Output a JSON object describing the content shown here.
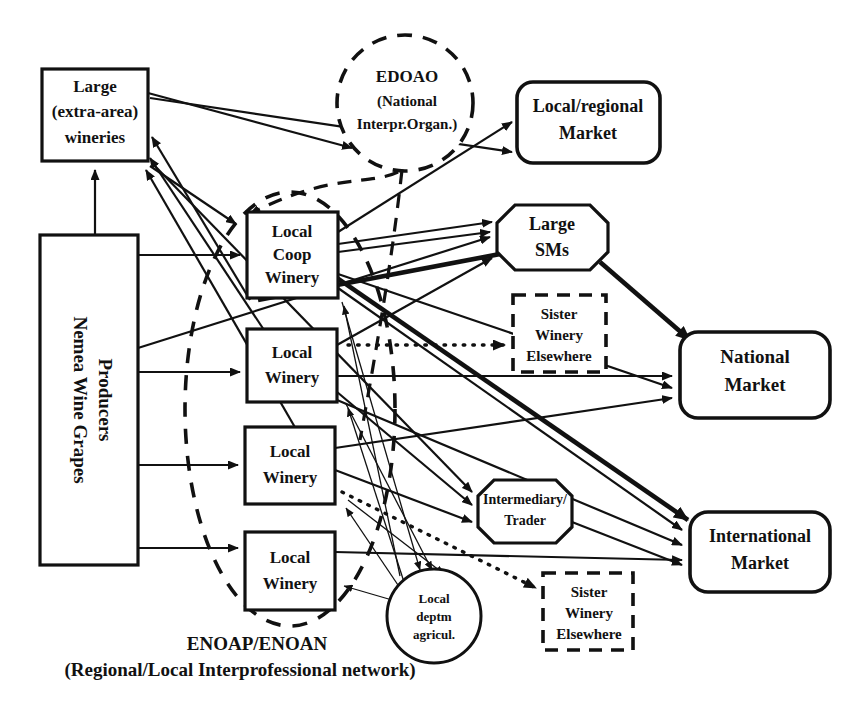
{
  "diagram": {
    "type": "network-flow-diagram",
    "colors": {
      "stroke": "#111111",
      "fill": "#ffffff",
      "background": "#ffffff"
    },
    "nodes": [
      {
        "id": "large-extra-area-wineries",
        "label": "Large\n(extra-area)\nwineries",
        "lines": [
          "Large",
          "(extra-area)",
          "wineries"
        ],
        "shape": "rectangle",
        "border": "solid"
      },
      {
        "id": "nemea-wine-grapes-producers",
        "label": "Nemea Wine Grapes Producers",
        "lines": [
          "Nemea Wine Grapes",
          "Producers"
        ],
        "shape": "rectangle",
        "border": "solid",
        "orientation": "vertical"
      },
      {
        "id": "edoao",
        "label": "EDOAO (National Interpr.Organ.)",
        "lines": [
          "EDOAO",
          "(National",
          "Interpr.Organ.)"
        ],
        "shape": "circle",
        "border": "dashed"
      },
      {
        "id": "local-coop-winery",
        "label": "Local Coop Winery",
        "lines": [
          "Local",
          "Coop",
          "Winery"
        ],
        "shape": "rectangle",
        "border": "solid"
      },
      {
        "id": "local-winery-1",
        "label": "Local Winery",
        "lines": [
          "Local",
          "Winery"
        ],
        "shape": "rectangle",
        "border": "solid"
      },
      {
        "id": "local-winery-2",
        "label": "Local Winery",
        "lines": [
          "Local",
          "Winery"
        ],
        "shape": "rectangle",
        "border": "solid"
      },
      {
        "id": "local-winery-3",
        "label": "Local Winery",
        "lines": [
          "Local",
          "Winery"
        ],
        "shape": "rectangle",
        "border": "solid"
      },
      {
        "id": "local-regional-market",
        "label": "Local/regional Market",
        "lines": [
          "Local/regional",
          "Market"
        ],
        "shape": "rounded-rectangle",
        "border": "solid"
      },
      {
        "id": "large-sms",
        "label": "Large SMs",
        "lines": [
          "Large",
          "SMs"
        ],
        "shape": "octagon",
        "border": "solid"
      },
      {
        "id": "sister-winery-elsewhere-top",
        "label": "Sister Winery Elsewhere",
        "lines": [
          "Sister",
          "Winery",
          "Elsewhere"
        ],
        "shape": "rectangle",
        "border": "dashed"
      },
      {
        "id": "national-market",
        "label": "National Market",
        "lines": [
          "National",
          "Market"
        ],
        "shape": "rounded-rectangle",
        "border": "solid"
      },
      {
        "id": "intermediary-trader",
        "label": "Intermediary/ Trader",
        "lines": [
          "Intermediary/",
          "Trader"
        ],
        "shape": "octagon",
        "border": "solid"
      },
      {
        "id": "international-market",
        "label": "International Market",
        "lines": [
          "International",
          "Market"
        ],
        "shape": "rounded-rectangle",
        "border": "solid"
      },
      {
        "id": "local-deptm-agricul",
        "label": "Local deptm agricul.",
        "lines": [
          "Local",
          "deptm",
          "agricul."
        ],
        "shape": "circle",
        "border": "solid"
      },
      {
        "id": "sister-winery-elsewhere-bottom",
        "label": "Sister Winery Elsewhere",
        "lines": [
          "Sister",
          "Winery",
          "Elsewhere"
        ],
        "shape": "rectangle",
        "border": "dashed"
      }
    ],
    "groups": [
      {
        "id": "enoap-enoan-group",
        "shape": "dashed-ellipse",
        "caption_lines": [
          "ENOAP/ENOAN",
          "(Regional/Local Interprofessional network)"
        ],
        "caption_line1": "ENOAP/ENOAN",
        "caption_line2": "(Regional/Local Interprofessional network)"
      }
    ]
  }
}
